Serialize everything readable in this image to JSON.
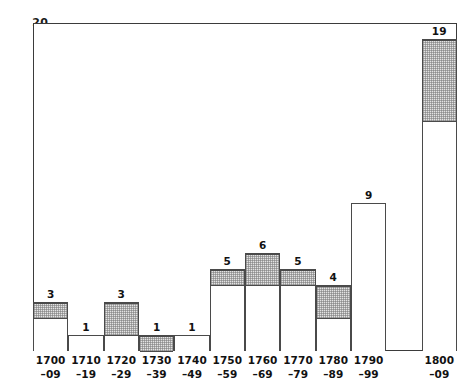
{
  "chart_data": {
    "type": "bar",
    "title": "",
    "subtitle": "",
    "xlabel": "",
    "ylabel": "",
    "xlim_note": "decadal bins 1700-09 through 1800-09 with one empty slot between 1790-99 and 1800-09",
    "ylim": [
      0,
      20
    ],
    "yticks": [
      0,
      5,
      10,
      15,
      20
    ],
    "ytick_labels": [
      "",
      "5",
      "10",
      "15",
      "20"
    ],
    "grid": false,
    "legend": false,
    "categories": [
      "1700–09",
      "1710–19",
      "1720–29",
      "1730–39",
      "1740–49",
      "1750–59",
      "1760–69",
      "1770–79",
      "1780–89",
      "1790–99",
      "",
      "1800–09"
    ],
    "values": [
      3,
      1,
      3,
      1,
      1,
      5,
      6,
      5,
      4,
      9,
      0,
      19
    ],
    "data_labels": [
      "3",
      "1",
      "3",
      "1",
      "1",
      "5",
      "6",
      "5",
      "4",
      "9",
      "",
      "19"
    ],
    "series": [
      {
        "name": "total",
        "values": [
          3,
          1,
          3,
          1,
          1,
          5,
          6,
          5,
          4,
          9,
          0,
          19
        ]
      },
      {
        "name": "shaded portion (hatched)",
        "shaded_from": [
          2,
          null,
          1,
          0,
          null,
          4,
          4,
          4,
          2,
          null,
          null,
          14
        ],
        "shaded_to": [
          3,
          null,
          3,
          1,
          null,
          5,
          6,
          5,
          4,
          null,
          null,
          19
        ],
        "values": [
          1,
          0,
          2,
          1,
          0,
          1,
          2,
          1,
          2,
          0,
          0,
          5
        ]
      }
    ],
    "colors": {
      "axis": "#3b3b3b",
      "bar_outline": "#4a4a4a",
      "bar_fill": "#ffffff",
      "shade_fill": "#e3e3e3",
      "text": "#111111",
      "background": "#ffffff"
    }
  },
  "axes": {
    "y": {
      "ticks": [
        {
          "label": "20",
          "value": 20
        },
        {
          "label": "15",
          "value": 15
        },
        {
          "label": "10",
          "value": 10
        },
        {
          "label": "5",
          "value": 5
        }
      ]
    },
    "x": {
      "ticks": [
        {
          "line1": "1700",
          "line2": "–09"
        },
        {
          "line1": "1710",
          "line2": "–19"
        },
        {
          "line1": "1720",
          "line2": "–29"
        },
        {
          "line1": "1730",
          "line2": "–39"
        },
        {
          "line1": "1740",
          "line2": "–49"
        },
        {
          "line1": "1750",
          "line2": "–59"
        },
        {
          "line1": "1760",
          "line2": "–69"
        },
        {
          "line1": "1770",
          "line2": "–79"
        },
        {
          "line1": "1780",
          "line2": "–89"
        },
        {
          "line1": "1790",
          "line2": "–99"
        },
        {
          "line1": "",
          "line2": ""
        },
        {
          "line1": "1800",
          "line2": "–09"
        }
      ]
    }
  }
}
